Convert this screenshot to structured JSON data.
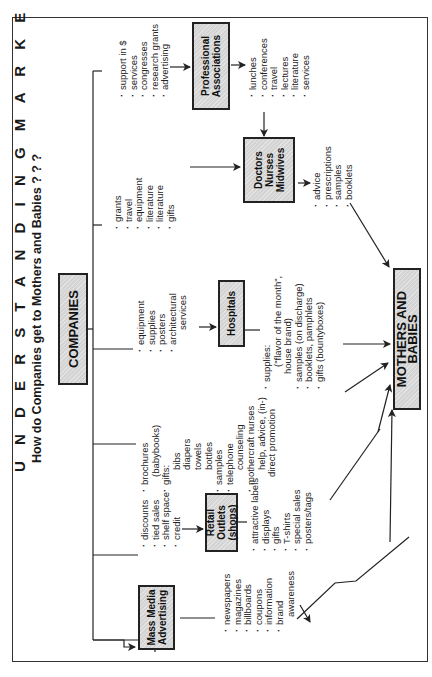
{
  "title": "U N D E R S T A N D I N G   M A R K E T I N G",
  "subtitle": "How do Companies get to Mothers and Babies ? ? ?",
  "nodes": {
    "companies": "COMPANIES",
    "mass_media": [
      "Mass Media",
      "Advertising"
    ],
    "retail": [
      "Retail Outlets",
      "(shops)"
    ],
    "hospitals": "Hospitals",
    "doctors": [
      "Doctors",
      "Nurses",
      "Midwives"
    ],
    "professional": [
      "Professional",
      "Associations"
    ],
    "mothers": "MOTHERS AND BABIES"
  },
  "lists": {
    "to_retail": [
      "discounts",
      "tied sales",
      "shelf space",
      "credit"
    ],
    "mass_media_out": [
      "newspapers",
      "magazines",
      "billboards",
      "coupons",
      "information",
      "brand",
      "awareness"
    ],
    "retail_out": [
      "attractive labels",
      "displays",
      "gifts",
      "T-shirts",
      "special sales",
      "posters/tags"
    ],
    "direct": {
      "brochures": "brochures",
      "brochures_sub": "(babybooks)",
      "gifts": "gifts:",
      "gift_items": [
        "bibs",
        "diapers",
        "towels",
        "bottles"
      ],
      "samples": "samples",
      "telephone": "telephone",
      "telephone_sub": "counseling",
      "mothercraft": "mothercraft nurses",
      "mothercraft_sub1": "help, advice, (in-)",
      "mothercraft_sub2": "direct promotion"
    },
    "to_hospitals": [
      "equipment",
      "supplies",
      "posters",
      "architectural"
    ],
    "to_hospitals_sub": "services",
    "hospitals_out": {
      "supplies": "supplies:",
      "supplies_sub1": "(\"flavor of the month\",",
      "supplies_sub2": "house brand)",
      "samples": "samples (on discharge)",
      "booklets": "booklets, pamphlets",
      "gifts": "gifts (bountyboxes)"
    },
    "to_doctors": [
      "grants",
      "travel",
      "equipment",
      "literature",
      "literature",
      "gifts"
    ],
    "doctors_out": [
      "advice",
      "prescriptions",
      "samples",
      "booklets"
    ],
    "to_professional": [
      "support in $",
      "services",
      "congresses",
      "research grants",
      "advertising"
    ],
    "professional_out": [
      "lunches",
      "conferences",
      "travel",
      "lectures",
      "literature",
      "services"
    ]
  },
  "colors": {
    "box_fill": "#d4d4d4",
    "line": "#222222",
    "background": "#ffffff"
  }
}
